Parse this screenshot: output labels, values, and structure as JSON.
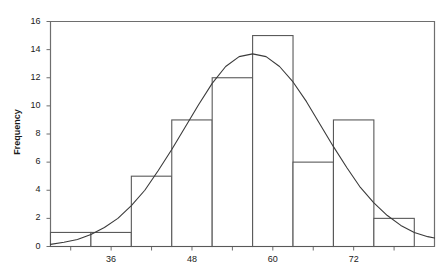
{
  "chart_data": {
    "type": "bar",
    "title": "",
    "subtitle": "",
    "xlabel": "",
    "ylabel": "Frequency",
    "grid": false,
    "legend": "none",
    "xlim": [
      27,
      84
    ],
    "ylim": [
      0,
      16
    ],
    "bin_width": 6,
    "bin_edges": [
      27,
      33,
      39,
      45,
      51,
      57,
      63,
      69,
      75,
      81
    ],
    "categories": [
      "27-33",
      "33-39",
      "39-45",
      "45-51",
      "51-57",
      "57-63",
      "63-69",
      "69-75",
      "75-81"
    ],
    "values": [
      1,
      1,
      5,
      9,
      12,
      15,
      6,
      9,
      2
    ],
    "bar_style": "outlined",
    "bar_fill": "#ffffff",
    "bar_edge_color": "#595959",
    "yticks": [
      0,
      2,
      4,
      6,
      8,
      10,
      12,
      14,
      16
    ],
    "ytick_labels": [
      "0",
      "2",
      "4",
      "6",
      "8",
      "10",
      "12",
      "14",
      "16"
    ],
    "xticks_labeled": [
      36,
      48,
      60,
      72
    ],
    "xtick_labels": [
      "36",
      "48",
      "60",
      "72"
    ],
    "xticks_minor": [
      30,
      42,
      54,
      66,
      78
    ],
    "overlay": {
      "type": "line",
      "name": "normal-density-curve",
      "color": "#3b3b3b",
      "peak_x": 58,
      "peak_y": 13.7,
      "mean": 58,
      "std": 9.4,
      "points_x": [
        27,
        29,
        31,
        33,
        35,
        37,
        39,
        41,
        43,
        45,
        47,
        49,
        51,
        53,
        55,
        57,
        59,
        61,
        63,
        65,
        67,
        69,
        71,
        73,
        75,
        77,
        79,
        81,
        83,
        84
      ],
      "points_y": [
        0.15,
        0.3,
        0.5,
        0.85,
        1.35,
        2.0,
        2.9,
        4.0,
        5.4,
        6.9,
        8.5,
        10.1,
        11.6,
        12.8,
        13.5,
        13.7,
        13.5,
        12.8,
        11.7,
        10.3,
        8.7,
        7.1,
        5.6,
        4.2,
        3.1,
        2.2,
        1.5,
        1.0,
        0.7,
        0.6
      ]
    },
    "axes": {
      "frame": true,
      "frame_color": "#6e6e6e"
    }
  },
  "colors": {
    "background": "#ffffff",
    "text": "#1a1a1a",
    "frame": "#6e6e6e",
    "bar_edge": "#595959",
    "curve": "#3b3b3b"
  }
}
